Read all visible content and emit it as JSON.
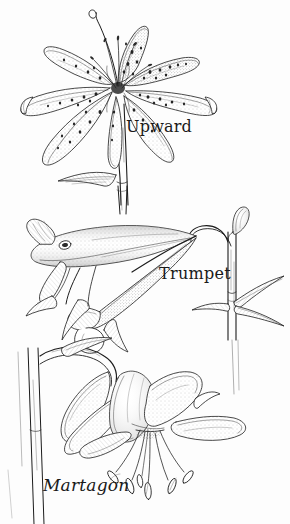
{
  "plate": {
    "medium": "pen-and-ink line drawing",
    "background_color": "#fdfdfd",
    "ink_color": "#1a1a1a",
    "subject": "lily flower forms"
  },
  "figures": [
    {
      "id": "upward",
      "label": "Upward",
      "description": "Upward-facing star-shaped lily with six spreading spotted petals, long exserted stamens and style, borne on an erect stem with a lanceolate leaf"
    },
    {
      "id": "trumpet",
      "label": "Trumpet",
      "description": "Horizontal trumpet-shaped lily with fused funnel-form tube and flaring recurved tips, nodding from an arching pedicel beside an upright leafy stem with a bud"
    },
    {
      "id": "martagon",
      "label": "Martagon",
      "description": "Pendant Turk's-cap lily with strongly recurved reflexed petals and long hanging stamens, suspended from a curved pedicel off a vertical stem"
    }
  ]
}
